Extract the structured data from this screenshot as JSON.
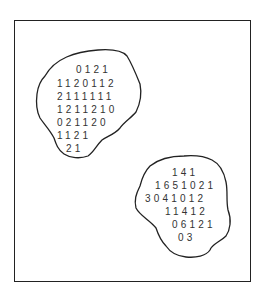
{
  "figure": {
    "colors": {
      "outline": "#222222",
      "digits": "#333333",
      "background": "#ffffff"
    }
  },
  "regions": [
    {
      "name": "upper-left-region",
      "rows": [
        "0121",
        "1120112",
        "2111111",
        "1211210",
        "021120",
        "1121",
        "21"
      ]
    },
    {
      "name": "lower-right-region",
      "rows": [
        "141",
        "1651021",
        "3041012",
        "11412",
        "06121",
        "03"
      ]
    }
  ]
}
